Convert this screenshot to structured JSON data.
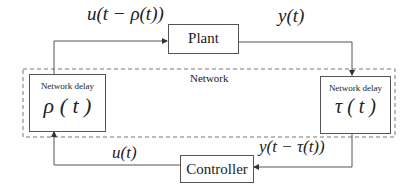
{
  "diagram": {
    "network_label": "Network",
    "plant": {
      "label": "Plant"
    },
    "controller": {
      "label": "Controller"
    },
    "delay_left": {
      "title": "Network delay",
      "symbol": "ρ ( t )"
    },
    "delay_right": {
      "title": "Network delay",
      "symbol": "τ ( t )"
    },
    "signals": {
      "plant_input": "u(t − ρ(t))",
      "plant_output": "y(t)",
      "controller_output": "u(t)",
      "controller_input": "y(t − τ(t))"
    },
    "colors": {
      "line": "#555555",
      "dashed": "#777777",
      "text": "#222222"
    }
  }
}
